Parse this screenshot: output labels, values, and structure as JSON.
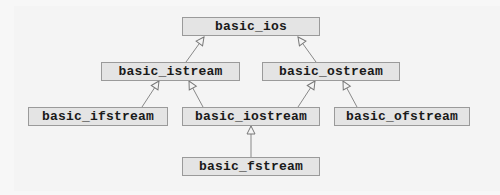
{
  "diagram": {
    "type": "class-hierarchy",
    "nodes": [
      {
        "id": "ios",
        "label": "basic_ios"
      },
      {
        "id": "istream",
        "label": "basic_istream"
      },
      {
        "id": "ostream",
        "label": "basic_ostream"
      },
      {
        "id": "ifstream",
        "label": "basic_ifstream"
      },
      {
        "id": "iostream",
        "label": "basic_iostream"
      },
      {
        "id": "ofstream",
        "label": "basic_ofstream"
      },
      {
        "id": "fstream",
        "label": "basic_fstream"
      }
    ],
    "edges": [
      {
        "from": "istream",
        "to": "ios",
        "kind": "inherits"
      },
      {
        "from": "ostream",
        "to": "ios",
        "kind": "inherits"
      },
      {
        "from": "ifstream",
        "to": "istream",
        "kind": "inherits"
      },
      {
        "from": "iostream",
        "to": "istream",
        "kind": "inherits"
      },
      {
        "from": "iostream",
        "to": "ostream",
        "kind": "inherits"
      },
      {
        "from": "ofstream",
        "to": "ostream",
        "kind": "inherits"
      },
      {
        "from": "fstream",
        "to": "iostream",
        "kind": "inherits"
      }
    ]
  }
}
